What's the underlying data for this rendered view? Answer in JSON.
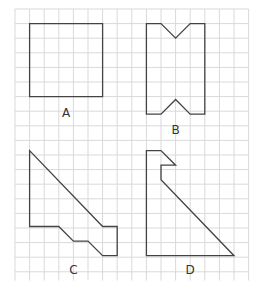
{
  "grid": {
    "origin_x": 15,
    "origin_y": 9,
    "cell": 14.6,
    "cols": 16,
    "rows": 18.6,
    "line_color": "#d9d9d9",
    "shape_color": "#444444"
  },
  "shapes": [
    {
      "label": "A",
      "points": [
        [
          1,
          1
        ],
        [
          6,
          1
        ],
        [
          6,
          6
        ],
        [
          1,
          6
        ]
      ],
      "label_pos": [
        3.5,
        7.1
      ]
    },
    {
      "label": "B",
      "points": [
        [
          9,
          1
        ],
        [
          10,
          1
        ],
        [
          11,
          2
        ],
        [
          12,
          1
        ],
        [
          13,
          1
        ],
        [
          13,
          7.2
        ],
        [
          12,
          7.2
        ],
        [
          11,
          6.2
        ],
        [
          10,
          7.2
        ],
        [
          9,
          7.2
        ]
      ],
      "label_pos": [
        11,
        8.3
      ]
    },
    {
      "label": "C",
      "points": [
        [
          1,
          9.7
        ],
        [
          6,
          14.9
        ],
        [
          7,
          14.9
        ],
        [
          7,
          16.9
        ],
        [
          6,
          16.9
        ],
        [
          5,
          15.9
        ],
        [
          4,
          15.9
        ],
        [
          3,
          14.9
        ],
        [
          1,
          14.9
        ]
      ],
      "label_pos": [
        4,
        17.9
      ]
    },
    {
      "label": "D",
      "points": [
        [
          9,
          9.7
        ],
        [
          10,
          9.7
        ],
        [
          11,
          10.7
        ],
        [
          10,
          10.7
        ],
        [
          10,
          11.7
        ],
        [
          15,
          16.9
        ],
        [
          9,
          16.9
        ]
      ],
      "label_pos": [
        12,
        17.9
      ]
    }
  ]
}
